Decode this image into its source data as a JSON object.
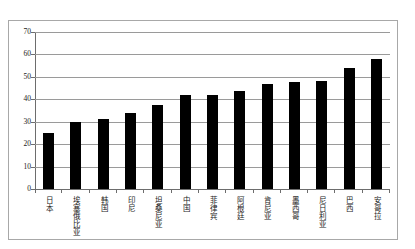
{
  "chart_data": {
    "type": "bar",
    "title": "",
    "subtitle": "",
    "xlabel": "",
    "ylabel": "",
    "ylim": [
      0,
      70
    ],
    "yticks": [
      70,
      60,
      50,
      40,
      30,
      20,
      10,
      0
    ],
    "ytick_labels": [
      "70",
      "60",
      "50",
      "40",
      "30",
      "20",
      "10",
      "0"
    ],
    "grid": true,
    "legend": false,
    "legend_position": "none",
    "bar_color": "#000000",
    "grid_color": "#9a9a9a",
    "axis_color": "#6d6d6d",
    "frame_color": "#a8a8a8",
    "categories": [
      "日本",
      "埃塞俄比亚",
      "韩国",
      "印尼",
      "坦桑尼亚",
      "中国",
      "菲律宾",
      "阿根廷",
      "肯尼亚",
      "墨西哥",
      "尼日利亚",
      "巴西",
      "安哥拉"
    ],
    "values": [
      25,
      30,
      31,
      34,
      37.5,
      42,
      42,
      43.5,
      47,
      47.5,
      48,
      54,
      58
    ]
  }
}
